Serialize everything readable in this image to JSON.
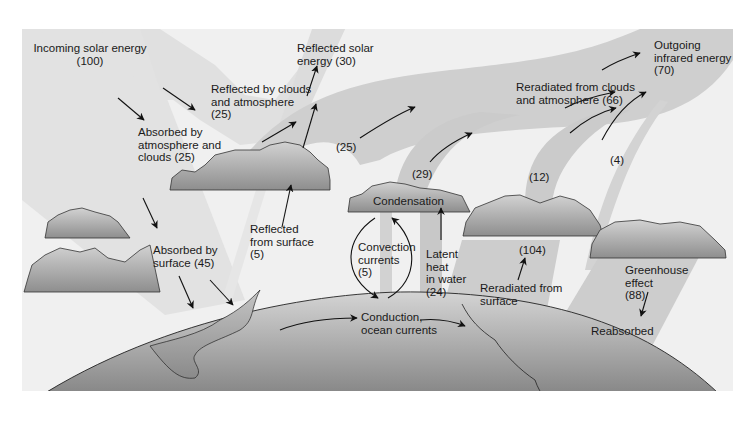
{
  "diagram": {
    "colors": {
      "panel": "#efefef",
      "band_light": "#e0e0e0",
      "band_medium": "#c9c9c9",
      "cloud_top": "#d0d0d0",
      "cloud_bottom": "#8f8f8f",
      "earth_top": "#cdcdcd",
      "earth_bottom": "#7a7a7a",
      "arrow": "#111111"
    },
    "labels": {
      "incoming_solar": "Incoming solar energy\n(100)",
      "reflected_solar": "Reflected solar\nenergy (30)",
      "reflected_clouds": "Reflected by clouds\nand atmosphere\n(25)",
      "absorbed_atmosphere": "Absorbed by\natmosphere and\nclouds (25)",
      "absorbed_surface": "Absorbed by\nsurface (45)",
      "reflected_surface": "Reflected\nfrom surface\n(5)",
      "outgoing_ir": "Outgoing\ninfrared energy\n(70)",
      "reradiated_clouds": "Reradiated from clouds\nand atmosphere (66)",
      "flow_25": "(25)",
      "flow_29": "(29)",
      "flow_12": "(12)",
      "flow_4": "(4)",
      "condensation": "Condensation",
      "convection": "Convection\ncurrents\n(5)",
      "latent_heat": "Latent\nheat\nin water\n(24)",
      "flow_104": "(104)",
      "reradiated_surface": "Reradiated from\nsurface",
      "greenhouse": "Greenhouse\neffect\n(88)",
      "reabsorbed": "Reabsorbed",
      "conduction": "Conduction,\nocean currents"
    }
  }
}
